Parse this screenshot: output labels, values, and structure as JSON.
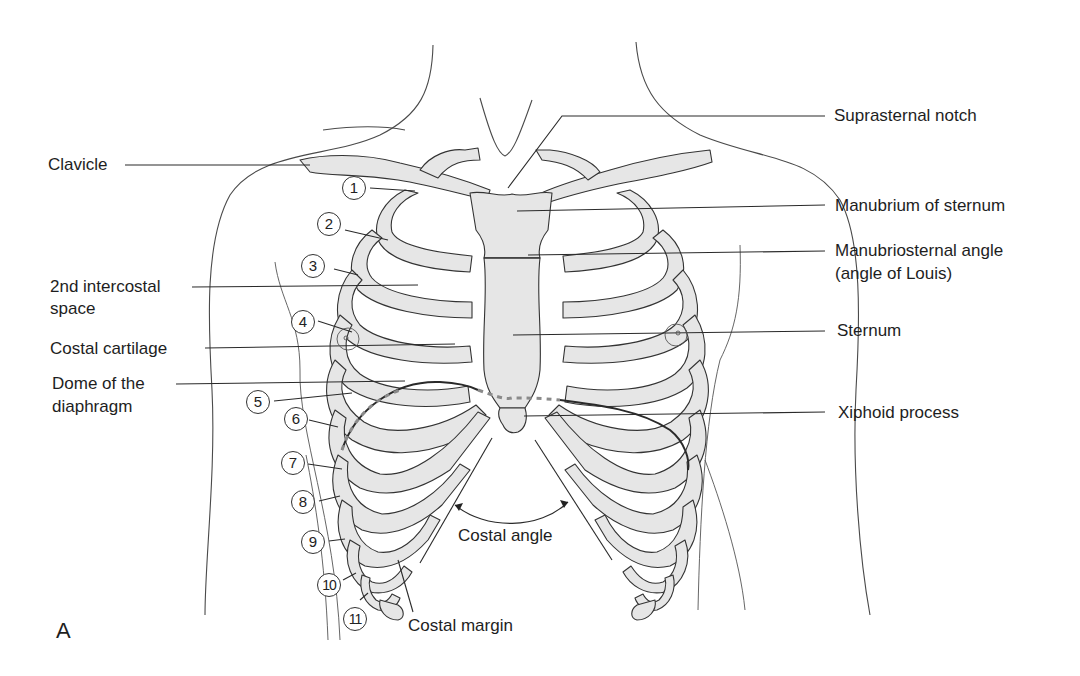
{
  "figure": {
    "panel_letter": "A",
    "colors": {
      "bone_fill": "#e6e6e6",
      "outline": "#333333",
      "text": "#1e1e1e",
      "background": "#ffffff"
    }
  },
  "labels_left": {
    "clavicle": "Clavicle",
    "intercostal_line1": "2nd intercostal",
    "intercostal_line2": "space",
    "costal_cartilage": "Costal cartilage",
    "dome_line1": "Dome of the",
    "dome_line2": "diaphragm"
  },
  "labels_right": {
    "suprasternal_notch": "Suprasternal notch",
    "manubrium": "Manubrium of sternum",
    "manubriosternal_line1": "Manubriosternal angle",
    "manubriosternal_line2": "(angle of Louis)",
    "sternum": "Sternum",
    "xiphoid": "Xiphoid process"
  },
  "labels_bottom": {
    "costal_angle": "Costal angle",
    "costal_margin": "Costal margin"
  },
  "rib_numbers": [
    "1",
    "2",
    "3",
    "4",
    "5",
    "6",
    "7",
    "8",
    "9",
    "10",
    "11"
  ]
}
